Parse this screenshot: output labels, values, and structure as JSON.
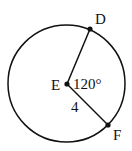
{
  "diagram": {
    "type": "circle-sector",
    "center_label": "E",
    "point_labels": [
      "D",
      "F"
    ],
    "angle_label": "120°",
    "radius_label": "4",
    "colors": {
      "stroke": "#111111",
      "background": "#ffffff"
    }
  }
}
